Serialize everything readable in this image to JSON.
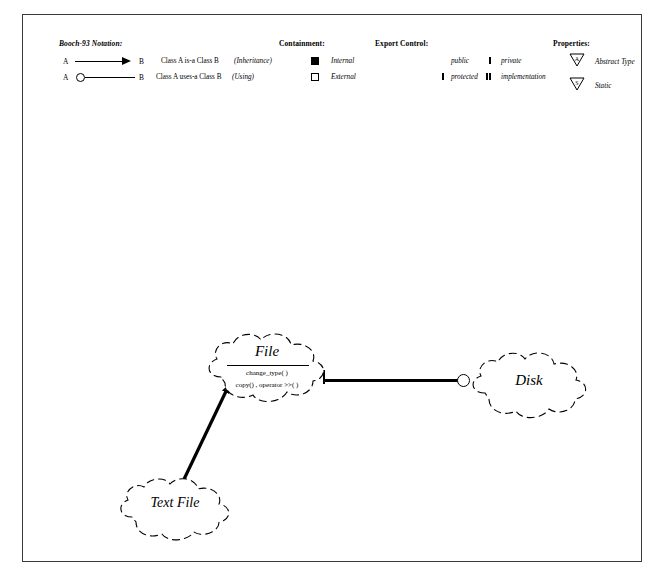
{
  "diagram": {
    "notation_title": "Booch-93 Notation:",
    "legend": {
      "relations": [
        {
          "from": "A",
          "to": "B",
          "symbol": "solid-arrow",
          "description": "Class A  is-a  Class B",
          "kind": "(Inheritance)"
        },
        {
          "from": "A",
          "to": "B",
          "symbol": "open-circle-line",
          "description": "Class A  uses-a  Class B",
          "kind": "(Using)"
        }
      ],
      "containment": {
        "title": "Containment:",
        "items": [
          {
            "marker": "filled-square",
            "label": "Internal"
          },
          {
            "marker": "hollow-square",
            "label": "External"
          }
        ]
      },
      "export_control": {
        "title": "Export Control:",
        "items": [
          {
            "marker": "none",
            "label": "public"
          },
          {
            "marker": "single-bar",
            "label": "protected"
          },
          {
            "marker": "single-bar",
            "label": "private"
          },
          {
            "marker": "double-bar",
            "label": "implementation"
          }
        ]
      },
      "properties": {
        "title": "Properties:",
        "items": [
          {
            "marker": "triangle-A",
            "glyph": "A",
            "label": "Abstract Type"
          },
          {
            "marker": "triangle-S",
            "glyph": "S",
            "label": "Static"
          }
        ]
      }
    },
    "classes": [
      {
        "id": "file",
        "name": "File",
        "operations": [
          "change_type( )",
          "copy() , operator >>( )"
        ]
      },
      {
        "id": "disk",
        "name": "Disk",
        "operations": []
      },
      {
        "id": "text-file",
        "name": "Text File",
        "operations": []
      }
    ],
    "relationships": [
      {
        "type": "uses-a",
        "from": "File",
        "to": "Disk"
      },
      {
        "type": "is-a",
        "from": "Text File",
        "to": "File"
      }
    ],
    "colors": {
      "ink": "#000000",
      "border": "#3a3a3a",
      "paper": "#ffffff"
    }
  }
}
